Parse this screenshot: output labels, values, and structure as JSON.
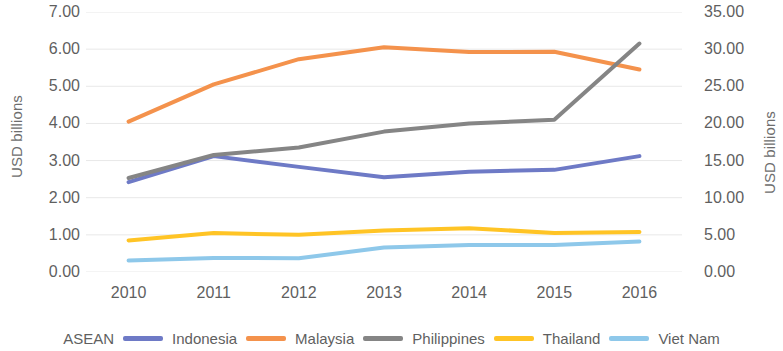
{
  "chart_data": {
    "type": "line",
    "title": "",
    "xlabel": "",
    "ylabel": "USD billions",
    "y2label": "USD billions",
    "categories": [
      "2010",
      "2011",
      "2012",
      "2013",
      "2014",
      "2015",
      "2016"
    ],
    "x": [
      2010,
      2011,
      2012,
      2013,
      2014,
      2015,
      2016
    ],
    "ylim": [
      0,
      7
    ],
    "y2lim": [
      0,
      35
    ],
    "yticks": [
      "0.00",
      "1.00",
      "2.00",
      "3.00",
      "4.00",
      "5.00",
      "6.00",
      "7.00"
    ],
    "y2ticks": [
      "0.00",
      "5.00",
      "10.00",
      "15.00",
      "20.00",
      "25.00",
      "30.00",
      "35.00"
    ],
    "grid": true,
    "grid_color": "#e8e8e8",
    "legend_position": "bottom",
    "legend_prefix": "ASEAN",
    "series": [
      {
        "name": "Indonesia",
        "color": "#6e7ac6",
        "axis": "left",
        "values": [
          2.42,
          3.12,
          2.83,
          2.55,
          2.7,
          2.75,
          3.12
        ]
      },
      {
        "name": "Malaysia",
        "color": "#f4924c",
        "axis": "left",
        "values": [
          4.05,
          5.05,
          5.73,
          6.05,
          5.92,
          5.93,
          5.45
        ]
      },
      {
        "name": "Philippines",
        "color": "#858585",
        "axis": "left",
        "values": [
          2.53,
          3.15,
          3.35,
          3.78,
          4.0,
          4.1,
          6.15
        ]
      },
      {
        "name": "Thailand",
        "color": "#ffc425",
        "axis": "left",
        "values": [
          0.85,
          1.05,
          1.0,
          1.12,
          1.18,
          1.05,
          1.08
        ]
      },
      {
        "name": "Viet Nam",
        "color": "#8ec8ea",
        "axis": "left",
        "values": [
          0.31,
          0.38,
          0.37,
          0.66,
          0.73,
          0.73,
          0.82
        ]
      }
    ]
  },
  "axes": {
    "left_title": "USD billions",
    "right_title": "USD billions"
  }
}
